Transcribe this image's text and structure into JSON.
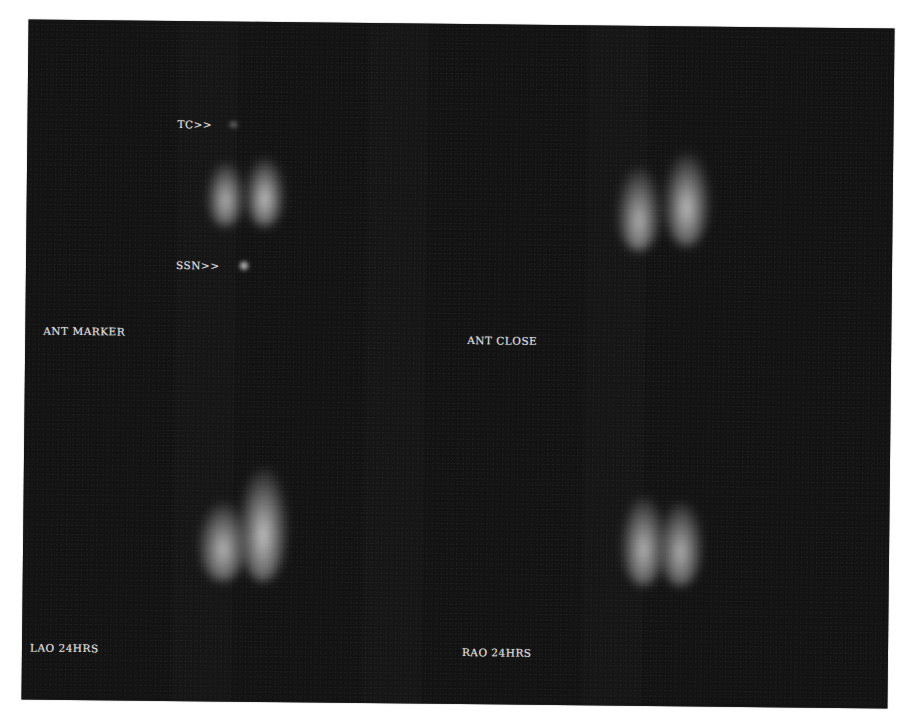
{
  "image": {
    "type": "thyroid scintigraphy scan",
    "background_color": "#121212",
    "label_color": "#d8d8d8"
  },
  "panels": [
    {
      "id": "top-left",
      "label": "ANT MARKER",
      "markers": [
        {
          "label": "TC>>"
        },
        {
          "label": "SSN>>"
        }
      ]
    },
    {
      "id": "top-right",
      "label": "ANT CLOSE",
      "markers": []
    },
    {
      "id": "bottom-left",
      "label": "LAO 24HRS",
      "markers": []
    },
    {
      "id": "bottom-right",
      "label": "RAO 24HRS",
      "markers": []
    }
  ]
}
